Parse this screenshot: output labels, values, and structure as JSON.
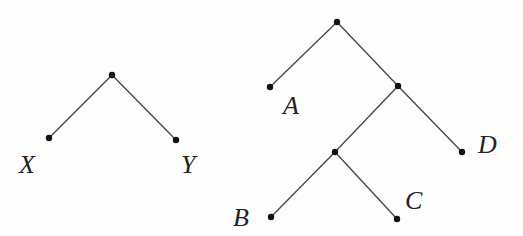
{
  "trees": [
    {
      "name": "left-tree",
      "nodes": [
        {
          "id": "r1",
          "x": 112,
          "y": 75,
          "label": ""
        },
        {
          "id": "X",
          "x": 49,
          "y": 138,
          "label": "X"
        },
        {
          "id": "Y",
          "x": 176,
          "y": 140,
          "label": "Y"
        }
      ],
      "edges": [
        [
          "r1",
          "X"
        ],
        [
          "r1",
          "Y"
        ]
      ]
    },
    {
      "name": "right-tree",
      "nodes": [
        {
          "id": "r2",
          "x": 337,
          "y": 22,
          "label": ""
        },
        {
          "id": "A",
          "x": 270,
          "y": 87,
          "label": "A"
        },
        {
          "id": "n1",
          "x": 398,
          "y": 86,
          "label": ""
        },
        {
          "id": "D",
          "x": 462,
          "y": 152,
          "label": "D"
        },
        {
          "id": "n2",
          "x": 335,
          "y": 152,
          "label": ""
        },
        {
          "id": "B",
          "x": 271,
          "y": 217,
          "label": "B"
        },
        {
          "id": "C",
          "x": 397,
          "y": 219,
          "label": "C"
        }
      ],
      "edges": [
        [
          "r2",
          "A"
        ],
        [
          "r2",
          "n1"
        ],
        [
          "n1",
          "D"
        ],
        [
          "n1",
          "n2"
        ],
        [
          "n2",
          "B"
        ],
        [
          "n2",
          "C"
        ]
      ]
    }
  ],
  "labels": {
    "X": "X",
    "Y": "Y",
    "A": "A",
    "B": "B",
    "C": "C",
    "D": "D"
  }
}
